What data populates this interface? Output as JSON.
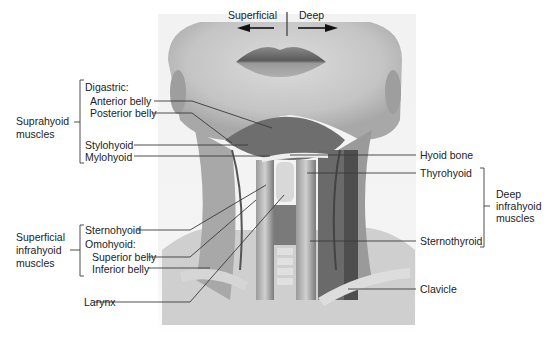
{
  "orientation": {
    "left_label": "Superficial",
    "right_label": "Deep",
    "left_arrow_icon": "arrow-left-icon",
    "right_arrow_icon": "arrow-right-icon"
  },
  "groups": {
    "suprahyoid": {
      "label_line1": "Suprahyoid",
      "label_line2": "muscles"
    },
    "superficial_infrahyoid": {
      "label_line1": "Superficial",
      "label_line2": "infrahyoid",
      "label_line3": "muscles"
    },
    "deep_infrahyoid": {
      "label_line1": "Deep",
      "label_line2": "infrahyoid",
      "label_line3": "muscles"
    }
  },
  "labels": {
    "digastric": "Digastric:",
    "anterior_belly": "Anterior belly",
    "posterior_belly": "Posterior belly",
    "stylohyoid": "Stylohyoid",
    "mylohyoid": "Mylohyoid",
    "sternohyoid": "Sternohyoid",
    "omohyoid": "Omohyoid:",
    "superior_belly": "Superior belly",
    "inferior_belly": "Inferior belly",
    "larynx": "Larynx",
    "hyoid_bone": "Hyoid bone",
    "thyrohyoid": "Thyrohyoid",
    "sternothyroid": "Sternothyroid",
    "clavicle": "Clavicle"
  },
  "colors": {
    "background": "#ffffff",
    "skin_light": "#e8e8e8",
    "skin_mid": "#bdbdbd",
    "muscle_dark": "#5a5a5a",
    "leader_line": "#3a3a3a"
  }
}
